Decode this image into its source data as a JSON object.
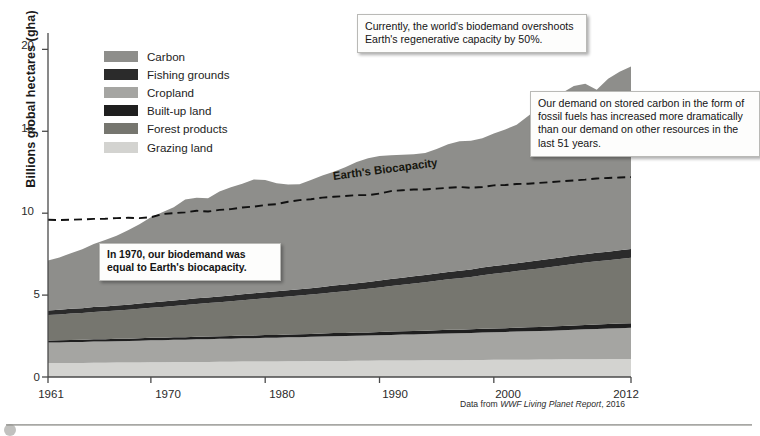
{
  "axis": {
    "ylabel": "Billions global hectares (gha)",
    "yticks": [
      "0",
      "5",
      "10",
      "15",
      "20"
    ],
    "xticks": [
      "1961",
      "1970",
      "1980",
      "1990",
      "2000",
      "2012"
    ]
  },
  "source": {
    "prefix": "Data from ",
    "italic": "WWF Living Planet Report",
    "suffix": ", 2016"
  },
  "legend": {
    "items": [
      {
        "label": "Carbon",
        "color": "#8e8e8b"
      },
      {
        "label": "Fishing grounds",
        "color": "#2b2b2b"
      },
      {
        "label": "Cropland",
        "color": "#a5a5a2"
      },
      {
        "label": "Built-up land",
        "color": "#1f1f1f"
      },
      {
        "label": "Forest products",
        "color": "#76766f"
      },
      {
        "label": "Grazing land",
        "color": "#d3d3d0"
      }
    ]
  },
  "annotations": {
    "biocapacity_label": "Earth's Biocapacity",
    "callouts": [
      {
        "name": "callout-overshoot",
        "text": "Currently, the world's biodemand overshoots Earth's regenerative capacity by 50%.",
        "bold": false
      },
      {
        "name": "callout-carbon",
        "text": "Our demand on stored carbon in the form of fossil fuels has increased more dramatically than our demand on other resources in the last 51 years.",
        "bold": false
      },
      {
        "name": "callout-1970",
        "text": "In 1970, our biodemand was equal to Earth's biocapacity.",
        "bold": true
      }
    ]
  },
  "chart_data": {
    "type": "area",
    "title": "",
    "xlabel": "",
    "ylabel": "Billions global hectares (gha)",
    "xlim": [
      1961,
      2012
    ],
    "ylim": [
      0,
      21
    ],
    "grid": false,
    "legend_position": "upper-left-inside",
    "stacked": true,
    "stack_order_bottom_to_top": [
      "Grazing land",
      "Cropland",
      "Built-up land",
      "Forest products",
      "Fishing grounds",
      "Carbon"
    ],
    "x": [
      1961,
      1962,
      1963,
      1964,
      1965,
      1966,
      1967,
      1968,
      1969,
      1970,
      1971,
      1972,
      1973,
      1974,
      1975,
      1976,
      1977,
      1978,
      1979,
      1980,
      1981,
      1982,
      1983,
      1984,
      1985,
      1986,
      1987,
      1988,
      1989,
      1990,
      1991,
      1992,
      1993,
      1994,
      1995,
      1996,
      1997,
      1998,
      1999,
      2000,
      2001,
      2002,
      2003,
      2004,
      2005,
      2006,
      2007,
      2008,
      2009,
      2010,
      2011,
      2012
    ],
    "series": [
      {
        "name": "Grazing land",
        "color": "#d3d3d0",
        "values": [
          0.85,
          0.85,
          0.86,
          0.86,
          0.87,
          0.87,
          0.88,
          0.88,
          0.89,
          0.9,
          0.9,
          0.91,
          0.91,
          0.92,
          0.92,
          0.93,
          0.93,
          0.94,
          0.94,
          0.95,
          0.95,
          0.96,
          0.96,
          0.97,
          0.97,
          0.98,
          0.98,
          0.99,
          0.99,
          1.0,
          1.0,
          1.01,
          1.01,
          1.02,
          1.02,
          1.03,
          1.03,
          1.04,
          1.04,
          1.05,
          1.05,
          1.06,
          1.06,
          1.07,
          1.07,
          1.08,
          1.08,
          1.09,
          1.09,
          1.1,
          1.1,
          1.1
        ]
      },
      {
        "name": "Cropland",
        "color": "#a5a5a2",
        "values": [
          1.25,
          1.26,
          1.27,
          1.28,
          1.29,
          1.3,
          1.31,
          1.32,
          1.33,
          1.34,
          1.35,
          1.36,
          1.37,
          1.38,
          1.39,
          1.4,
          1.41,
          1.42,
          1.43,
          1.44,
          1.45,
          1.46,
          1.47,
          1.48,
          1.5,
          1.51,
          1.52,
          1.53,
          1.54,
          1.55,
          1.57,
          1.58,
          1.59,
          1.6,
          1.62,
          1.63,
          1.64,
          1.65,
          1.67,
          1.68,
          1.7,
          1.71,
          1.73,
          1.74,
          1.76,
          1.78,
          1.8,
          1.82,
          1.84,
          1.86,
          1.88,
          1.9
        ]
      },
      {
        "name": "Built-up land",
        "color": "#1f1f1f",
        "values": [
          0.13,
          0.13,
          0.13,
          0.13,
          0.14,
          0.14,
          0.14,
          0.14,
          0.14,
          0.15,
          0.15,
          0.15,
          0.15,
          0.16,
          0.16,
          0.16,
          0.16,
          0.17,
          0.17,
          0.17,
          0.17,
          0.18,
          0.18,
          0.18,
          0.18,
          0.19,
          0.19,
          0.19,
          0.19,
          0.2,
          0.2,
          0.2,
          0.21,
          0.21,
          0.21,
          0.22,
          0.22,
          0.22,
          0.23,
          0.23,
          0.23,
          0.24,
          0.24,
          0.24,
          0.25,
          0.25,
          0.26,
          0.26,
          0.27,
          0.27,
          0.28,
          0.28
        ]
      },
      {
        "name": "Forest products",
        "color": "#76766f",
        "values": [
          1.55,
          1.58,
          1.61,
          1.64,
          1.67,
          1.7,
          1.73,
          1.76,
          1.8,
          1.84,
          1.88,
          1.92,
          1.96,
          2.0,
          2.04,
          2.08,
          2.12,
          2.16,
          2.2,
          2.24,
          2.28,
          2.32,
          2.36,
          2.4,
          2.45,
          2.5,
          2.55,
          2.6,
          2.66,
          2.72,
          2.78,
          2.84,
          2.9,
          2.96,
          3.02,
          3.08,
          3.14,
          3.2,
          3.27,
          3.34,
          3.4,
          3.46,
          3.52,
          3.58,
          3.64,
          3.7,
          3.76,
          3.82,
          3.86,
          3.9,
          3.95,
          4.0
        ]
      },
      {
        "name": "Fishing grounds",
        "color": "#2b2b2b",
        "values": [
          0.28,
          0.28,
          0.29,
          0.29,
          0.3,
          0.3,
          0.31,
          0.31,
          0.32,
          0.32,
          0.33,
          0.33,
          0.34,
          0.34,
          0.35,
          0.35,
          0.36,
          0.36,
          0.37,
          0.37,
          0.38,
          0.38,
          0.39,
          0.39,
          0.4,
          0.4,
          0.41,
          0.41,
          0.42,
          0.42,
          0.43,
          0.43,
          0.44,
          0.44,
          0.45,
          0.45,
          0.46,
          0.46,
          0.47,
          0.47,
          0.48,
          0.48,
          0.49,
          0.49,
          0.5,
          0.5,
          0.51,
          0.51,
          0.52,
          0.52,
          0.53,
          0.53
        ]
      },
      {
        "name": "Carbon",
        "color": "#8e8e8b",
        "values": [
          3.05,
          3.2,
          3.4,
          3.6,
          3.85,
          4.05,
          4.25,
          4.55,
          4.85,
          5.2,
          5.45,
          5.7,
          6.1,
          6.15,
          6.05,
          6.4,
          6.6,
          6.75,
          6.95,
          6.85,
          6.6,
          6.45,
          6.4,
          6.6,
          6.8,
          6.95,
          7.15,
          7.4,
          7.55,
          7.6,
          7.55,
          7.5,
          7.45,
          7.45,
          7.6,
          7.8,
          7.9,
          7.85,
          7.9,
          8.1,
          8.25,
          8.45,
          8.9,
          9.35,
          9.7,
          10.05,
          10.35,
          10.4,
          9.95,
          10.55,
          10.9,
          11.15
        ]
      },
      {
        "name": "Earth's Biocapacity",
        "type": "line",
        "style": "dashed",
        "color": "#111111",
        "values": [
          9.6,
          9.58,
          9.6,
          9.62,
          9.65,
          9.66,
          9.7,
          9.72,
          9.7,
          9.75,
          9.95,
          10.0,
          10.05,
          10.15,
          10.1,
          10.2,
          10.25,
          10.35,
          10.4,
          10.5,
          10.55,
          10.7,
          10.8,
          10.85,
          10.95,
          11.0,
          11.05,
          11.1,
          11.1,
          11.2,
          11.35,
          11.4,
          11.45,
          11.45,
          11.5,
          11.55,
          11.6,
          11.55,
          11.6,
          11.7,
          11.72,
          11.78,
          11.8,
          11.85,
          11.9,
          11.95,
          12.0,
          12.05,
          12.12,
          12.15,
          12.18,
          12.2
        ]
      }
    ],
    "total_biodemand": [
      7.11,
      7.3,
      7.56,
      7.8,
      8.12,
      8.36,
      8.62,
      8.94,
      9.33,
      9.75,
      10.06,
      10.37,
      10.83,
      10.95,
      10.91,
      11.32,
      11.58,
      11.8,
      12.06,
      12.02,
      11.83,
      11.75,
      11.76,
      12.02,
      12.3,
      12.53,
      12.8,
      13.12,
      13.35,
      13.49,
      13.53,
      13.56,
      13.6,
      13.68,
      13.92,
      14.21,
      14.39,
      14.42,
      14.58,
      14.87,
      15.11,
      15.4,
      15.94,
      16.47,
      16.92,
      17.36,
      17.77,
      17.9,
      17.53,
      18.15,
      18.64,
      19.01
    ]
  }
}
